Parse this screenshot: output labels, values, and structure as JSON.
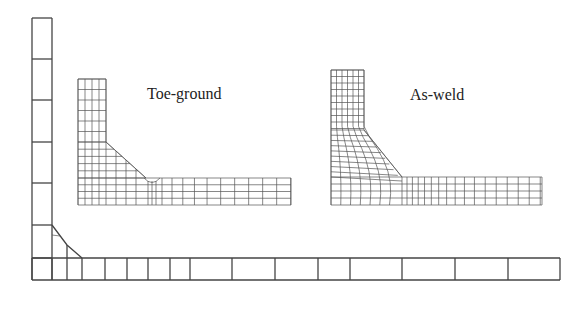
{
  "figure": {
    "background": "#ffffff",
    "line_color": "#444444"
  },
  "global_mesh": {
    "vertical_member": {
      "x": [
        32,
        52
      ],
      "y_lines": [
        18,
        59,
        100,
        142,
        183,
        225,
        258
      ]
    },
    "base_plate": {
      "y": [
        258,
        280
      ],
      "x_lines": [
        32,
        52,
        67,
        82,
        105,
        127,
        148,
        170,
        190,
        232,
        275,
        318,
        350,
        402,
        455,
        508,
        560
      ]
    },
    "weld": {
      "points": [
        [
          52,
          225
        ],
        [
          67,
          245
        ],
        [
          82,
          258
        ]
      ]
    }
  },
  "submodels": [
    {
      "id": "toe-ground",
      "label": "Toe-ground",
      "label_pos": [
        147,
        99
      ],
      "leg": {
        "x": [
          78,
          106
        ],
        "cols": 4,
        "y_top": 79
      },
      "plate": {
        "x_end": 291,
        "y": [
          178,
          205
        ],
        "rows": 4
      },
      "weld_toe": {
        "groove": true
      }
    },
    {
      "id": "as-weld",
      "label": "As-weld",
      "label_pos": [
        410,
        100
      ],
      "leg": {
        "x": [
          331,
          364
        ],
        "cols": 6,
        "y_top": 70
      },
      "plate": {
        "x_end": 542,
        "y": [
          177,
          205
        ],
        "rows": 4
      },
      "weld_toe": {
        "groove": false
      }
    }
  ]
}
